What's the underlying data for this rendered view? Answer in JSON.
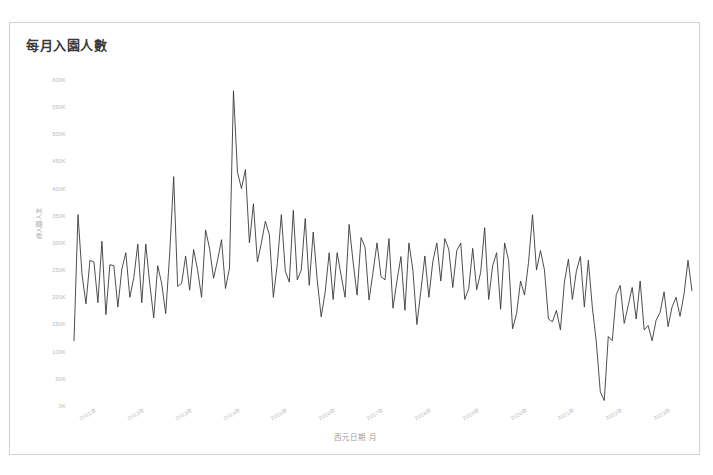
{
  "chart_panel": {
    "title": "每月入園人數",
    "caption": ""
  },
  "axes": {
    "y_title": "總入園人次",
    "x_title": "西元日期 月",
    "y_ticks": [
      "600K",
      "550K",
      "500K",
      "450K",
      "400K",
      "350K",
      "300K",
      "250K",
      "200K",
      "150K",
      "100K",
      "50K",
      "0K"
    ],
    "x_ticks": [
      "2011年",
      "2012年",
      "2013年",
      "2014年",
      "2015年",
      "2016年",
      "2017年",
      "2018年",
      "2019年",
      "2020年",
      "2021年",
      "2022年",
      "2023年"
    ]
  },
  "style": {
    "line_color": "#3a3a3a",
    "panel_border": "#d2d2d2",
    "tick_color": "#bdbdbd",
    "background": "#ffffff"
  },
  "chart_data": {
    "type": "line",
    "title": "每月入園人數",
    "xlabel": "西元日期 月",
    "ylabel": "總入園人次",
    "ylim": [
      0,
      620000
    ],
    "grid": false,
    "legend": "none",
    "x_tick_labels": [
      "2011年",
      "2012年",
      "2013年",
      "2014年",
      "2015年",
      "2016年",
      "2017年",
      "2018年",
      "2019年",
      "2020年",
      "2021年",
      "2022年",
      "2023年"
    ],
    "y_tick_values": [
      600000,
      550000,
      500000,
      450000,
      400000,
      350000,
      300000,
      250000,
      200000,
      150000,
      100000,
      50000,
      0
    ],
    "x_start": "2011-01",
    "x_end": "2023-12",
    "x_interval": "monthly",
    "series": [
      {
        "name": "每月入園人數",
        "x": [
          "2011-01",
          "2011-02",
          "2011-03",
          "2011-04",
          "2011-05",
          "2011-06",
          "2011-07",
          "2011-08",
          "2011-09",
          "2011-10",
          "2011-11",
          "2011-12",
          "2012-01",
          "2012-02",
          "2012-03",
          "2012-04",
          "2012-05",
          "2012-06",
          "2012-07",
          "2012-08",
          "2012-09",
          "2012-10",
          "2012-11",
          "2012-12",
          "2013-01",
          "2013-02",
          "2013-03",
          "2013-04",
          "2013-05",
          "2013-06",
          "2013-07",
          "2013-08",
          "2013-09",
          "2013-10",
          "2013-11",
          "2013-12",
          "2014-01",
          "2014-02",
          "2014-03",
          "2014-04",
          "2014-05",
          "2014-06",
          "2014-07",
          "2014-08",
          "2014-09",
          "2014-10",
          "2014-11",
          "2014-12",
          "2015-01",
          "2015-02",
          "2015-03",
          "2015-04",
          "2015-05",
          "2015-06",
          "2015-07",
          "2015-08",
          "2015-09",
          "2015-10",
          "2015-11",
          "2015-12",
          "2016-01",
          "2016-02",
          "2016-03",
          "2016-04",
          "2016-05",
          "2016-06",
          "2016-07",
          "2016-08",
          "2016-09",
          "2016-10",
          "2016-11",
          "2016-12",
          "2017-01",
          "2017-02",
          "2017-03",
          "2017-04",
          "2017-05",
          "2017-06",
          "2017-07",
          "2017-08",
          "2017-09",
          "2017-10",
          "2017-11",
          "2017-12",
          "2018-01",
          "2018-02",
          "2018-03",
          "2018-04",
          "2018-05",
          "2018-06",
          "2018-07",
          "2018-08",
          "2018-09",
          "2018-10",
          "2018-11",
          "2018-12",
          "2019-01",
          "2019-02",
          "2019-03",
          "2019-04",
          "2019-05",
          "2019-06",
          "2019-07",
          "2019-08",
          "2019-09",
          "2019-10",
          "2019-11",
          "2019-12",
          "2020-01",
          "2020-02",
          "2020-03",
          "2020-04",
          "2020-05",
          "2020-06",
          "2020-07",
          "2020-08",
          "2020-09",
          "2020-10",
          "2020-11",
          "2020-12",
          "2021-01",
          "2021-02",
          "2021-03",
          "2021-04",
          "2021-05",
          "2021-06",
          "2021-07",
          "2021-08",
          "2021-09",
          "2021-10",
          "2021-11",
          "2021-12",
          "2022-01",
          "2022-02",
          "2022-03",
          "2022-04",
          "2022-05",
          "2022-06",
          "2022-07",
          "2022-08",
          "2022-09",
          "2022-10",
          "2022-11",
          "2022-12",
          "2023-01",
          "2023-02",
          "2023-03",
          "2023-04",
          "2023-05",
          "2023-06",
          "2023-07",
          "2023-08",
          "2023-09",
          "2023-10",
          "2023-11",
          "2023-12"
        ],
        "values": [
          120000,
          352000,
          243000,
          188000,
          268000,
          265000,
          190000,
          303000,
          168000,
          260000,
          258000,
          182000,
          252000,
          282000,
          200000,
          236000,
          298000,
          190000,
          298000,
          225000,
          162000,
          258000,
          225000,
          170000,
          280000,
          422000,
          220000,
          226000,
          276000,
          213000,
          288000,
          250000,
          200000,
          324000,
          290000,
          235000,
          268000,
          306000,
          216000,
          254000,
          580000,
          430000,
          400000,
          435000,
          300000,
          372000,
          265000,
          300000,
          340000,
          315000,
          200000,
          262000,
          352000,
          248000,
          228000,
          360000,
          232000,
          250000,
          345000,
          222000,
          320000,
          232000,
          164000,
          210000,
          282000,
          196000,
          282000,
          240000,
          200000,
          334000,
          265000,
          204000,
          310000,
          292000,
          195000,
          246000,
          300000,
          238000,
          232000,
          308000,
          180000,
          230000,
          275000,
          176000,
          300000,
          250000,
          150000,
          212000,
          276000,
          200000,
          266000,
          300000,
          230000,
          308000,
          288000,
          218000,
          286000,
          300000,
          196000,
          216000,
          290000,
          214000,
          246000,
          328000,
          196000,
          258000,
          282000,
          178000,
          300000,
          268000,
          142000,
          170000,
          230000,
          204000,
          264000,
          352000,
          250000,
          286000,
          250000,
          160000,
          155000,
          176000,
          140000,
          228000,
          270000,
          196000,
          248000,
          275000,
          182000,
          268000,
          182000,
          118000,
          26000,
          10000,
          128000,
          120000,
          205000,
          222000,
          152000,
          185000,
          218000,
          160000,
          230000,
          140000,
          148000,
          120000,
          158000,
          172000,
          210000,
          146000,
          182000,
          200000,
          165000,
          206000,
          268000,
          212000
        ]
      }
    ]
  }
}
